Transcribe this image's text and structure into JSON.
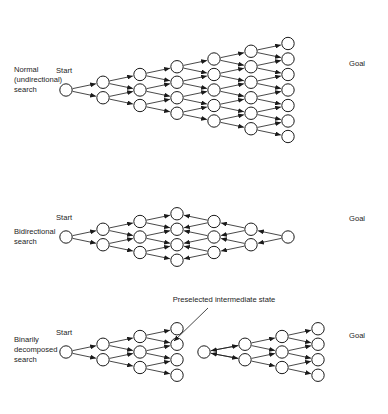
{
  "figure": {
    "background": "#ffffff",
    "ink": "#1a1a1a",
    "width": 388,
    "height": 414
  },
  "panels": [
    {
      "id": "normal",
      "label_lines": [
        "Normal",
        "(undirectional)",
        "search"
      ],
      "start_label": "Start",
      "goal_label": "Goal",
      "description": "Single expanding search frontier from Start toward Goal"
    },
    {
      "id": "bidirectional",
      "label_lines": [
        "Bidirectional",
        "search"
      ],
      "start_label": "Start",
      "goal_label": "Goal",
      "description": "Two frontiers expanding from Start and Goal meeting in the middle"
    },
    {
      "id": "binarily-decomposed",
      "label_lines": [
        "Binarily",
        "decomposed",
        "search"
      ],
      "start_label": "Start",
      "goal_label": "Goal",
      "description": "Two searches joined at a preselected intermediate state"
    }
  ],
  "annotation": {
    "text": "Preselected intermediate state",
    "x": 224,
    "y": 300
  },
  "chart_data": {
    "type": "diagram",
    "geometry": {
      "node_radius": 6.2,
      "col_spacing": 37,
      "row_spacing": 15.5
    },
    "panels": [
      {
        "id": "normal",
        "origin_y": 90,
        "start_node": {
          "x": 66,
          "y": 90
        },
        "columns": [
          {
            "x": 103,
            "offsets": [
              -1,
              1
            ]
          },
          {
            "x": 140,
            "offsets": [
              -2,
              0,
              2
            ]
          },
          {
            "x": 177,
            "offsets": [
              -3,
              -1,
              1,
              3
            ]
          },
          {
            "x": 214,
            "offsets": [
              -4,
              -2,
              0,
              2,
              4
            ]
          },
          {
            "x": 251,
            "offsets": [
              -5,
              -3,
              -1,
              1,
              3,
              5
            ]
          },
          {
            "x": 288,
            "offsets": [
              -6,
              -4,
              -2,
              0,
              2,
              4,
              6
            ]
          }
        ],
        "direction": "forward",
        "goal_at": {
          "x": 288,
          "offset": -2
        }
      },
      {
        "id": "bidirectional",
        "origin_y": 237,
        "start_node": {
          "x": 66,
          "y": 237
        },
        "goal_node": {
          "x": 288,
          "y": 237
        },
        "forward_columns": [
          {
            "x": 103,
            "offsets": [
              -1,
              1
            ]
          },
          {
            "x": 140,
            "offsets": [
              -2,
              0,
              2
            ]
          },
          {
            "x": 177,
            "offsets": [
              -3,
              -1,
              1,
              3
            ]
          }
        ],
        "backward_columns": [
          {
            "x": 251,
            "offsets": [
              -1,
              1
            ]
          },
          {
            "x": 214,
            "offsets": [
              -2,
              0,
              2
            ]
          }
        ],
        "direction": "bidirectional"
      },
      {
        "id": "binarily",
        "origin_y": 352,
        "start_node": {
          "x": 66,
          "y": 352
        },
        "goal_node": {
          "x": 318,
          "y": 352
        },
        "left_columns": [
          {
            "x": 103,
            "offsets": [
              -1,
              1
            ]
          },
          {
            "x": 140,
            "offsets": [
              -2,
              0,
              2
            ]
          },
          {
            "x": 177,
            "offsets": [
              -3,
              -1,
              1,
              3
            ]
          }
        ],
        "mid_node": {
          "x": 204,
          "y": 352
        },
        "right_columns": [
          {
            "x": 245,
            "offsets": [
              -1,
              1
            ]
          },
          {
            "x": 282,
            "offsets": [
              -2,
              0,
              2
            ]
          },
          {
            "x": 318,
            "offsets": [
              -3,
              -1,
              1,
              3
            ]
          }
        ],
        "direction": "forward-split"
      }
    ]
  }
}
